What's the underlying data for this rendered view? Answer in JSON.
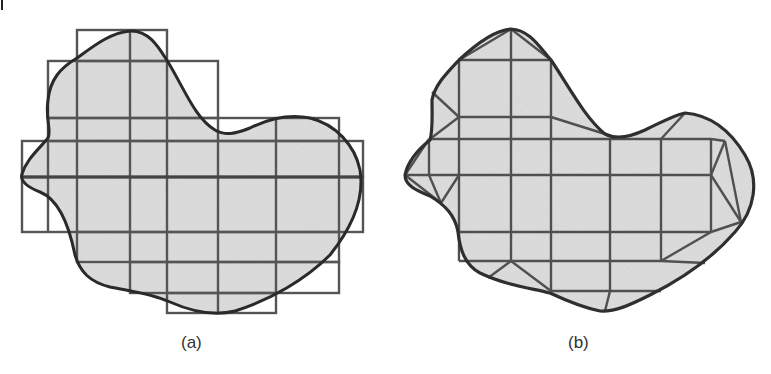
{
  "figure": {
    "panels": [
      {
        "id": "a",
        "caption": "(a)",
        "description": "Irregular shaded region overlaid by a grid of rectangular cells covering the boundary"
      },
      {
        "id": "b",
        "caption": "(b)",
        "description": "Same region meshed with interior rectangles and triangles conforming to the boundary"
      }
    ],
    "colors": {
      "fill": "#dcdcdc",
      "grid": "#555555",
      "boundary": "#2a2a2a"
    }
  }
}
